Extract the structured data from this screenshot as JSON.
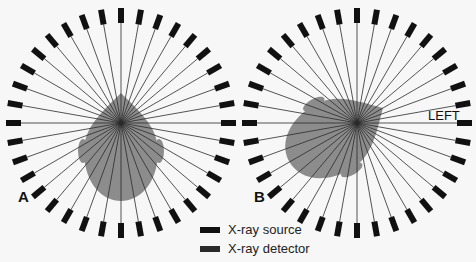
{
  "panels": [
    {
      "id": "A",
      "label": "A",
      "center": [
        121,
        123
      ],
      "head_orientation": "upright",
      "head_rotation_deg": 0
    },
    {
      "id": "B",
      "label": "B",
      "center": [
        357,
        123
      ],
      "head_orientation": "rotated to left side",
      "head_rotation_deg": 60,
      "annotation": "LEFT"
    }
  ],
  "ring": {
    "element_count": 36,
    "inner_radius": 100,
    "outer_radius": 115,
    "element_width": 6
  },
  "legend": {
    "items": [
      {
        "label": "X-ray source",
        "color": "#111111"
      },
      {
        "label": "X-ray detector",
        "color": "#222222"
      }
    ]
  },
  "colors": {
    "head": "#8c8c8c",
    "beam": "#2a2a2a",
    "block": "#111111",
    "background": "#f7f7f7"
  }
}
